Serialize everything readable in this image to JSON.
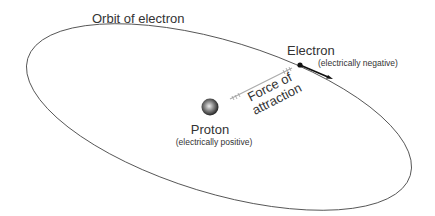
{
  "diagram": {
    "orbit_label": "Orbit of electron",
    "electron": {
      "label": "Electron",
      "sublabel": "(electrically negative)"
    },
    "proton": {
      "label": "Proton",
      "sublabel": "(electrically positive)"
    },
    "force": {
      "line1": "Force of",
      "line2": "attraction"
    },
    "colors": {
      "orbit": "#555555",
      "text": "#333333",
      "force_line": "#aaaaaa",
      "electron": "#111111"
    }
  }
}
